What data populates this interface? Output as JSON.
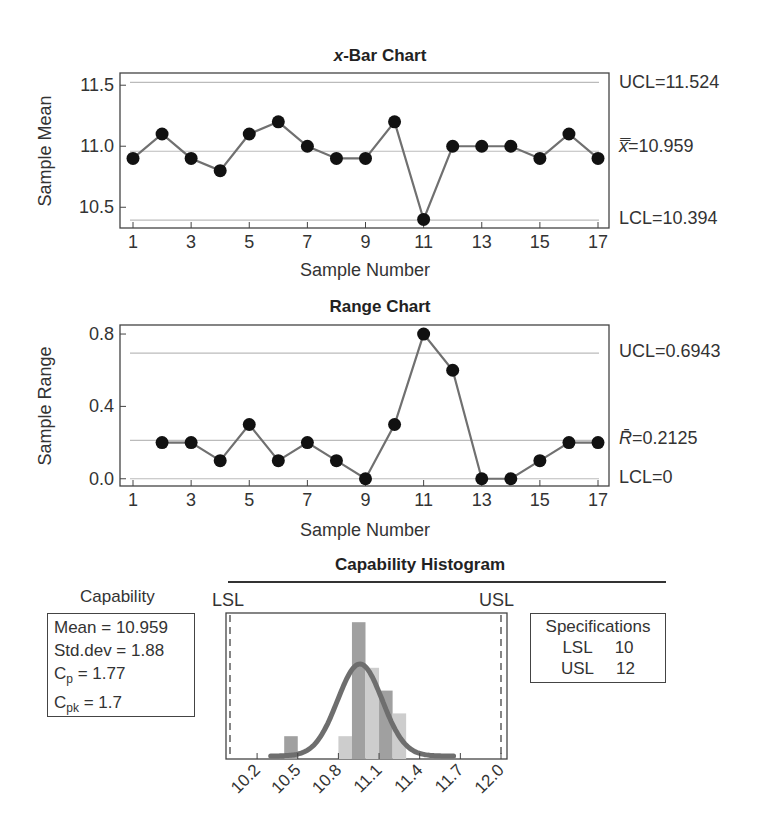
{
  "xbar_chart": {
    "title_italic": "x",
    "title_rest": "-Bar Chart",
    "ylabel": "Sample Mean",
    "xlabel": "Sample Number",
    "yticks": [
      "11.5",
      "11.0",
      "10.5"
    ],
    "xticks": [
      "1",
      "3",
      "5",
      "7",
      "9",
      "11",
      "13",
      "15",
      "17"
    ],
    "ucl_label": "UCL=11.524",
    "center_label_symbol": "x̿",
    "center_label_value": "=10.959",
    "lcl_label": "LCL=10.394"
  },
  "range_chart": {
    "title": "Range Chart",
    "ylabel": "Sample Range",
    "xlabel": "Sample Number",
    "yticks": [
      "0.8",
      "0.4",
      "0.0"
    ],
    "xticks": [
      "1",
      "3",
      "5",
      "7",
      "9",
      "11",
      "13",
      "15",
      "17"
    ],
    "ucl_label": "UCL=0.6943",
    "center_label_symbol": "R̄",
    "center_label_value": "=0.2125",
    "lcl_label": "LCL=0"
  },
  "capability": {
    "histogram_title": "Capability Histogram",
    "lsl_marker": "LSL",
    "usl_marker": "USL",
    "xticks": [
      "10.2",
      "10.5",
      "10.8",
      "11.1",
      "11.4",
      "11.7",
      "12.0"
    ],
    "stats_title": "Capability",
    "mean_line": "Mean = 10.959",
    "std_line": "Std.dev = 1.88",
    "cp_prefix": "C",
    "cp_sub": "p",
    "cp_value": " = 1.77",
    "cpk_prefix": "C",
    "cpk_sub": "pk",
    "cpk_value": " = 1.7",
    "spec_title": "Specifications",
    "spec_lsl_label": "LSL",
    "spec_lsl_value": "10",
    "spec_usl_label": "USL",
    "spec_usl_value": "12"
  },
  "colors": {
    "line": "#707070",
    "point": "#111111",
    "control_line": "#bbbbbb",
    "bar_dark": "#a0a0a0",
    "bar_light": "#cdcdcd",
    "curve": "#6e6e6e"
  },
  "chart_data": [
    {
      "type": "line",
      "title": "x-Bar Chart",
      "xlabel": "Sample Number",
      "ylabel": "Sample Mean",
      "x": [
        1,
        2,
        3,
        4,
        5,
        6,
        7,
        8,
        9,
        10,
        11,
        12,
        13,
        14,
        15,
        16,
        17
      ],
      "values": [
        10.9,
        11.1,
        10.9,
        10.8,
        11.1,
        11.2,
        11.0,
        10.9,
        10.9,
        11.2,
        10.4,
        11.0,
        11.0,
        11.0,
        10.9,
        11.1,
        10.9
      ],
      "ylim": [
        10.33,
        11.6
      ],
      "control_limits": {
        "UCL": 11.524,
        "center": 10.959,
        "LCL": 10.394
      },
      "grid": false
    },
    {
      "type": "line",
      "title": "Range Chart",
      "xlabel": "Sample Number",
      "ylabel": "Sample Range",
      "x": [
        2,
        3,
        4,
        5,
        6,
        7,
        8,
        9,
        10,
        11,
        12,
        13,
        14,
        15,
        16,
        17
      ],
      "values": [
        0.2,
        0.2,
        0.1,
        0.3,
        0.1,
        0.2,
        0.1,
        0.0,
        0.3,
        0.8,
        0.6,
        0.0,
        0.0,
        0.1,
        0.2,
        0.2
      ],
      "ylim": [
        -0.04,
        0.85
      ],
      "control_limits": {
        "UCL": 0.6943,
        "center": 0.2125,
        "LCL": 0
      },
      "grid": false
    },
    {
      "type": "bar",
      "title": "Capability Histogram",
      "categories": [
        "10.4-10.5",
        "10.8-10.9",
        "10.9-11.0",
        "11.0-11.1",
        "11.1-11.2",
        "11.2-11.3"
      ],
      "bin_centers": [
        10.45,
        10.85,
        10.95,
        11.05,
        11.15,
        11.25
      ],
      "values": [
        1,
        1,
        6,
        4,
        3,
        2
      ],
      "xlim": [
        10.0,
        12.05
      ],
      "xticks": [
        10.2,
        10.5,
        10.8,
        11.1,
        11.4,
        11.7,
        12.0
      ],
      "spec_limits": {
        "LSL": 10,
        "USL": 12
      },
      "normal_curve": {
        "mean": 10.959,
        "note": "fitted normal overlay"
      },
      "stats": {
        "Mean": 10.959,
        "Std.dev": 1.88,
        "Cp": 1.77,
        "Cpk": 1.7
      }
    }
  ]
}
